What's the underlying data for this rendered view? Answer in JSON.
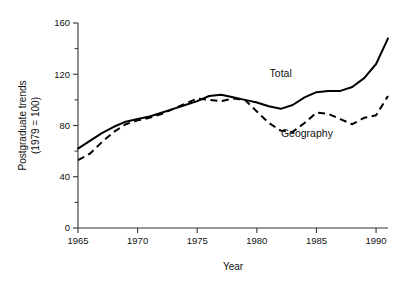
{
  "chart_data": {
    "type": "line",
    "title": "",
    "xlabel": "Year",
    "ylabel": "Postgraduate trends\n(1979 = 100)",
    "ylabel_line1": "Postgraduate trends",
    "ylabel_line2": "(1979 = 100)",
    "xlim": [
      1965,
      1991
    ],
    "ylim": [
      0,
      160
    ],
    "xticks": [
      1965,
      1970,
      1975,
      1980,
      1985,
      1990
    ],
    "xtick_labels": [
      "1965",
      "1970",
      "1975",
      "1980",
      "1985",
      "1990"
    ],
    "yticks": [
      0,
      40,
      80,
      120,
      160
    ],
    "ytick_labels": [
      "0",
      "40",
      "80",
      "120",
      "160"
    ],
    "yticks_minor": [
      20,
      60,
      100,
      140
    ],
    "grid": false,
    "legend": "inline-annotations",
    "annotations": [
      {
        "text": "Total",
        "x": 1982.0,
        "y": 118
      },
      {
        "text": "Geography",
        "x": 1984.2,
        "y": 71
      }
    ],
    "series": [
      {
        "name": "Total",
        "style": "solid",
        "x": [
          1965,
          1966,
          1967,
          1968,
          1969,
          1970,
          1971,
          1972,
          1973,
          1974,
          1975,
          1976,
          1977,
          1978,
          1979,
          1980,
          1981,
          1982,
          1983,
          1984,
          1985,
          1986,
          1987,
          1988,
          1989,
          1990,
          1991
        ],
        "values": [
          62,
          68,
          74,
          79,
          83,
          85,
          87,
          90,
          93,
          96,
          99,
          103,
          104,
          102,
          100,
          98,
          95,
          93,
          96,
          102,
          106,
          107,
          107,
          110,
          117,
          128,
          148
        ]
      },
      {
        "name": "Geography",
        "style": "dashed",
        "x": [
          1965,
          1966,
          1967,
          1968,
          1969,
          1970,
          1971,
          1972,
          1973,
          1974,
          1975,
          1976,
          1977,
          1978,
          1979,
          1980,
          1981,
          1982,
          1983,
          1984,
          1985,
          1986,
          1987,
          1988,
          1989,
          1990,
          1991
        ],
        "values": [
          53,
          58,
          67,
          75,
          81,
          84,
          86,
          89,
          93,
          97,
          101,
          100,
          99,
          101,
          100,
          91,
          82,
          76,
          75,
          82,
          90,
          89,
          85,
          81,
          86,
          88,
          103
        ]
      }
    ]
  },
  "geometry": {
    "plot_left_px": 78,
    "plot_right_px": 388,
    "plot_top_px": 23,
    "plot_bottom_px": 228
  }
}
